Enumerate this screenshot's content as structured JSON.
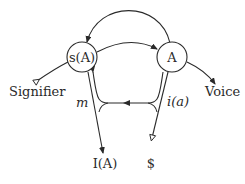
{
  "diagram": {
    "type": "graph-of-desire",
    "nodes": {
      "signified_of_other": "s(A)",
      "other": "A"
    },
    "labels": {
      "signifier": "Signifier",
      "voice": "Voice",
      "ego": "m",
      "ego_image": "i(a)",
      "ego_ideal": "I(A)",
      "barred_subject": "$"
    },
    "colors": {
      "stroke": "#2a2a2a",
      "background": "#ffffff"
    }
  }
}
